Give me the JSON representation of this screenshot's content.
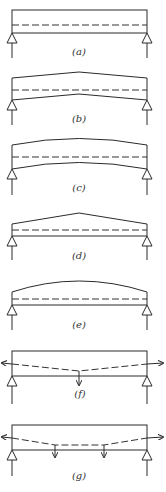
{
  "figure": {
    "panels": [
      {
        "id": "a",
        "label": "(a)",
        "description": "Straight beam, straight tendon"
      },
      {
        "id": "b",
        "label": "(b)",
        "description": "Beam with peaked (angled) top and bottom, straight tendon"
      },
      {
        "id": "c",
        "label": "(c)",
        "description": "Curved (cambered) beam, straight tendon"
      },
      {
        "id": "d",
        "label": "(d)",
        "description": "Beam with peaked top only, flat bottom, straight tendon"
      },
      {
        "id": "e",
        "label": "(e)",
        "description": "Beam with curved top only, flat bottom, straight tendon"
      },
      {
        "id": "f",
        "label": "(f)",
        "description": "Rectangular beam, harped tendon with single deflection point at midspan, end forces and one downward force"
      },
      {
        "id": "g",
        "label": "(g)",
        "description": "Rectangular beam, tendon with two deflection points, end forces and two downward forces"
      }
    ],
    "colors": {
      "line": "#2a2a2a",
      "background": "#ffffff"
    }
  }
}
